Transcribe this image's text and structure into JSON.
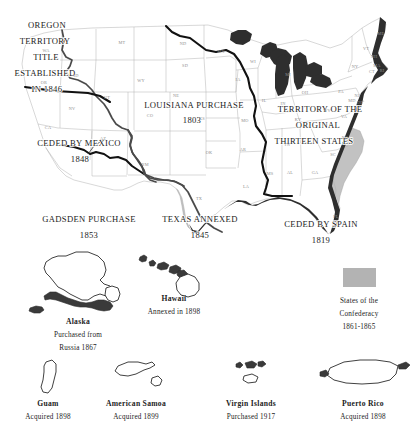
{
  "map": {
    "title": "United States Territorial Acquisitions",
    "territories": [
      {
        "id": "oregon",
        "lines": [
          "OREGON",
          "TERRITORY",
          "TITLE",
          "ESTABLISHED",
          "IN 1846"
        ]
      },
      {
        "id": "louisiana",
        "lines": [
          "LOUISIANA PURCHASE",
          "1803"
        ]
      },
      {
        "id": "thirteen",
        "lines": [
          "TERRITORY OF THE",
          "ORIGINAL",
          "THIRTEEN STATES"
        ]
      },
      {
        "id": "mexico",
        "lines": [
          "CEDED BY MEXICO",
          "1848"
        ]
      },
      {
        "id": "gadsden",
        "lines": [
          "GADSDEN PURCHASE",
          "1853"
        ]
      },
      {
        "id": "texas",
        "lines": [
          "TEXAS ANNEXED",
          "1845"
        ]
      },
      {
        "id": "spain",
        "lines": [
          "CEDED BY SPAIN",
          "1819"
        ]
      }
    ],
    "state_abbreviations": [
      {
        "abbr": "WA",
        "x": 46,
        "y": 52
      },
      {
        "abbr": "OR",
        "x": 44,
        "y": 84
      },
      {
        "abbr": "ID",
        "x": 76,
        "y": 77
      },
      {
        "abbr": "MT",
        "x": 122,
        "y": 44
      },
      {
        "abbr": "ND",
        "x": 183,
        "y": 45
      },
      {
        "abbr": "SD",
        "x": 185,
        "y": 67
      },
      {
        "abbr": "NE",
        "x": 176,
        "y": 97
      },
      {
        "abbr": "MN",
        "x": 221,
        "y": 53
      },
      {
        "abbr": "IA",
        "x": 238,
        "y": 81
      },
      {
        "abbr": "WI",
        "x": 253,
        "y": 63
      },
      {
        "abbr": "MI",
        "x": 288,
        "y": 76
      },
      {
        "abbr": "WY",
        "x": 141,
        "y": 82
      },
      {
        "abbr": "NV",
        "x": 72,
        "y": 110
      },
      {
        "abbr": "UT",
        "x": 107,
        "y": 99
      },
      {
        "abbr": "CA",
        "x": 48,
        "y": 129
      },
      {
        "abbr": "AZ",
        "x": 103,
        "y": 140
      },
      {
        "abbr": "CO",
        "x": 150,
        "y": 117
      },
      {
        "abbr": "NM",
        "x": 145,
        "y": 166
      },
      {
        "abbr": "KS",
        "x": 202,
        "y": 120
      },
      {
        "abbr": "OK",
        "x": 209,
        "y": 154
      },
      {
        "abbr": "MO",
        "x": 245,
        "y": 122
      },
      {
        "abbr": "AR",
        "x": 243,
        "y": 151
      },
      {
        "abbr": "LA",
        "x": 246,
        "y": 188
      },
      {
        "abbr": "MS",
        "x": 270,
        "y": 175
      },
      {
        "abbr": "AL",
        "x": 290,
        "y": 174
      },
      {
        "abbr": "GA",
        "x": 315,
        "y": 174
      },
      {
        "abbr": "TN",
        "x": 287,
        "y": 146
      },
      {
        "abbr": "IL",
        "x": 264,
        "y": 102
      },
      {
        "abbr": "IN",
        "x": 283,
        "y": 105
      },
      {
        "abbr": "OH",
        "x": 305,
        "y": 94
      },
      {
        "abbr": "KY",
        "x": 298,
        "y": 121
      },
      {
        "abbr": "SC",
        "x": 333,
        "y": 156
      },
      {
        "abbr": "NC",
        "x": 345,
        "y": 139
      },
      {
        "abbr": "VA",
        "x": 344,
        "y": 118
      },
      {
        "abbr": "WV",
        "x": 327,
        "y": 112
      },
      {
        "abbr": "PA",
        "x": 341,
        "y": 93
      },
      {
        "abbr": "NY",
        "x": 355,
        "y": 68
      },
      {
        "abbr": "ME",
        "x": 381,
        "y": 35
      },
      {
        "abbr": "VT",
        "x": 366,
        "y": 50
      },
      {
        "abbr": "NH",
        "x": 374,
        "y": 58
      },
      {
        "abbr": "MA",
        "x": 377,
        "y": 67
      },
      {
        "abbr": "CT",
        "x": 372,
        "y": 73
      },
      {
        "abbr": "RI",
        "x": 382,
        "y": 72
      },
      {
        "abbr": "NJ",
        "x": 357,
        "y": 97
      },
      {
        "abbr": "DE",
        "x": 360,
        "y": 104
      },
      {
        "abbr": "MD",
        "x": 352,
        "y": 102
      },
      {
        "abbr": "TX",
        "x": 199,
        "y": 200
      },
      {
        "abbr": "FL",
        "x": 336,
        "y": 218
      }
    ]
  },
  "insets": [
    {
      "id": "alaska",
      "name": "Alaska",
      "sub1": "Purchased from",
      "sub2": "Russia 1867"
    },
    {
      "id": "hawaii",
      "name": "Hawaii",
      "sub1": "Annexed in 1898",
      "sub2": ""
    },
    {
      "id": "guam",
      "name": "Guam",
      "sub1": "Acquired 1898",
      "sub2": ""
    },
    {
      "id": "american-samoa",
      "name": "American Samoa",
      "sub1": "Acquired 1899",
      "sub2": ""
    },
    {
      "id": "virgin-islands",
      "name": "Virgin Islands",
      "sub1": "Purchased 1917",
      "sub2": ""
    },
    {
      "id": "puerto-rico",
      "name": "Puerto Rico",
      "sub1": "Acquired 1898",
      "sub2": ""
    }
  ],
  "legend": {
    "line1": "States of the",
    "line2": "Confederacy",
    "line3": "1861-1865",
    "swatch_color": "#b3b3b3"
  }
}
